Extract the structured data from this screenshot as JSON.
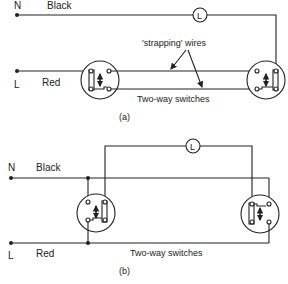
{
  "diagram_a": {
    "caption": "(a)",
    "neutral": {
      "terminal": "N",
      "wire_color": "Black"
    },
    "live": {
      "terminal": "L",
      "wire_color": "Red"
    },
    "lamp_label": "L",
    "strapping_label": "'strapping' wires",
    "switches_label": "Two-way switches"
  },
  "diagram_b": {
    "caption": "(b)",
    "neutral": {
      "terminal": "N",
      "wire_color": "Black"
    },
    "live": {
      "terminal": "L",
      "wire_color": "Red"
    },
    "lamp_label": "L",
    "switches_label": "Two-way switches"
  }
}
